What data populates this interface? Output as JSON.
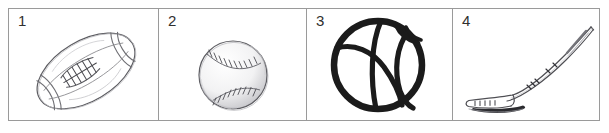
{
  "worksheet": {
    "title": "Sports equipment picture grid",
    "panel_count": 4,
    "frame_color": "#9a9a9a",
    "background_color": "#ffffff",
    "ink_color": "#3a3a3a",
    "bold_ink_color": "#1b1b1b",
    "cells": [
      {
        "number": "1",
        "item_name": "football",
        "icon": "american-football-icon",
        "description": "Line drawing of an American football tilted diagonally with laces and seam bands",
        "style": "thin grey outline sketch"
      },
      {
        "number": "2",
        "item_name": "baseball",
        "icon": "baseball-icon",
        "description": "Line drawing of a baseball with two curved stitched seams",
        "style": "thin grey outline sketch with shading"
      },
      {
        "number": "3",
        "item_name": "basketball",
        "icon": "basketball-icon",
        "description": "Bold black outline drawing of a basketball with curved panel lines",
        "style": "heavy black outline"
      },
      {
        "number": "4",
        "item_name": "hockey-stick",
        "icon": "hockey-stick-icon",
        "description": "Line drawing of an ice hockey stick with blade at lower left and shaft angled to upper right",
        "style": "thin grey outline sketch"
      }
    ]
  }
}
